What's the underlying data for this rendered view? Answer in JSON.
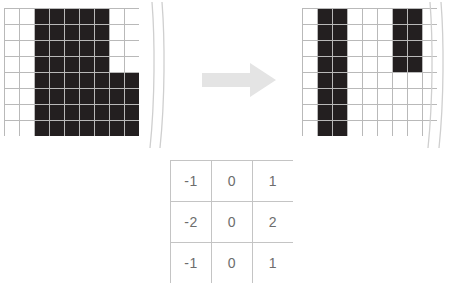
{
  "figure": {
    "background_color": "#ffffff",
    "pixel_on_color": "#231f20",
    "pixel_off_color": "#ffffff",
    "grid_line_color": "#b9b9b9",
    "arrow_color": "#e4e4e4",
    "kernel_border_color": "#c4c4c4",
    "kernel_text_color": "#6d6d6d"
  },
  "input_grid": {
    "label": "input-image-grid",
    "columns": 9,
    "rows": 8,
    "cell_width": 14,
    "cell_height": 15,
    "cells": [
      [
        0,
        0,
        1,
        1,
        1,
        1,
        1,
        0,
        0
      ],
      [
        0,
        0,
        1,
        1,
        1,
        1,
        1,
        0,
        0
      ],
      [
        0,
        0,
        1,
        1,
        1,
        1,
        1,
        0,
        0
      ],
      [
        0,
        0,
        1,
        1,
        1,
        1,
        1,
        0,
        0
      ],
      [
        0,
        0,
        1,
        1,
        1,
        1,
        1,
        1,
        1
      ],
      [
        0,
        0,
        1,
        1,
        1,
        1,
        1,
        1,
        1
      ],
      [
        0,
        0,
        1,
        1,
        1,
        1,
        1,
        1,
        1
      ],
      [
        0,
        0,
        1,
        1,
        1,
        1,
        1,
        1,
        1
      ]
    ]
  },
  "output_grid": {
    "label": "output-edge-grid",
    "columns": 9,
    "rows": 8,
    "cell_width": 14,
    "cell_height": 15,
    "cells": [
      [
        0,
        1,
        1,
        0,
        0,
        0,
        1,
        1,
        0
      ],
      [
        0,
        1,
        1,
        0,
        0,
        0,
        1,
        1,
        0
      ],
      [
        0,
        1,
        1,
        0,
        0,
        0,
        1,
        1,
        0
      ],
      [
        0,
        1,
        1,
        0,
        0,
        0,
        1,
        1,
        0
      ],
      [
        0,
        1,
        1,
        0,
        0,
        0,
        0,
        0,
        0
      ],
      [
        0,
        1,
        1,
        0,
        0,
        0,
        0,
        0,
        0
      ],
      [
        0,
        1,
        1,
        0,
        0,
        0,
        0,
        0,
        0
      ],
      [
        0,
        1,
        1,
        0,
        0,
        0,
        0,
        0,
        0
      ]
    ]
  },
  "arrow": {
    "label": "transform-arrow",
    "direction": "right",
    "color": "#e4e4e4"
  },
  "kernel": {
    "label": "sobel-x-kernel",
    "rows": 3,
    "columns": 3,
    "values": [
      [
        "-1",
        "0",
        "1"
      ],
      [
        "-2",
        "0",
        "2"
      ],
      [
        "-1",
        "0",
        "1"
      ]
    ]
  },
  "page_edges": {
    "left_label": "scanned-page-edge-left",
    "right_label": "scanned-page-edge-right",
    "color": "#cfcfcf"
  }
}
